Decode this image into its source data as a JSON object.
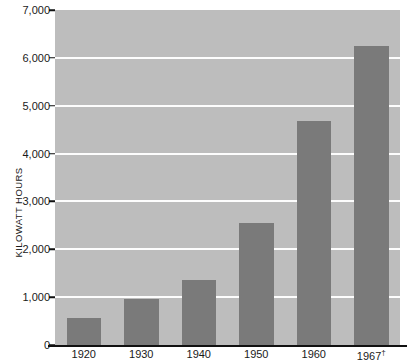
{
  "chart_data": {
    "type": "bar",
    "title": "",
    "subtitle": "",
    "xlabel": "",
    "ylabel": "KILOWATT HOURS",
    "categories": [
      "1920",
      "1930",
      "1940",
      "1950",
      "1960",
      "1967"
    ],
    "values": [
      570,
      960,
      1350,
      2550,
      4680,
      6250
    ],
    "ylim": [
      0,
      7000
    ],
    "xlim_note": "",
    "y_ticks": [
      0,
      1000,
      2000,
      3000,
      4000,
      5000,
      6000,
      7000
    ],
    "y_tick_labels": [
      "0",
      "1,000",
      "2,000",
      "3,000",
      "4,000",
      "5,000",
      "6,000",
      "7,000"
    ],
    "x_tick_labels": [
      "1920",
      "1930",
      "1940",
      "1950",
      "1960",
      "1967"
    ],
    "footnote_marker": "†",
    "footnote_on_category": "1967",
    "grid": true,
    "grid_axis": "y",
    "legend": null,
    "legend_position": "none",
    "annotations": []
  },
  "style": {
    "plot_background": "#bdbdbd",
    "bar_color": "#7a7a7a",
    "gridline_color": "#fdfdfd",
    "axis_color": "#111111",
    "text_color": "#1a1a1a",
    "page_background": "#ffffff"
  }
}
